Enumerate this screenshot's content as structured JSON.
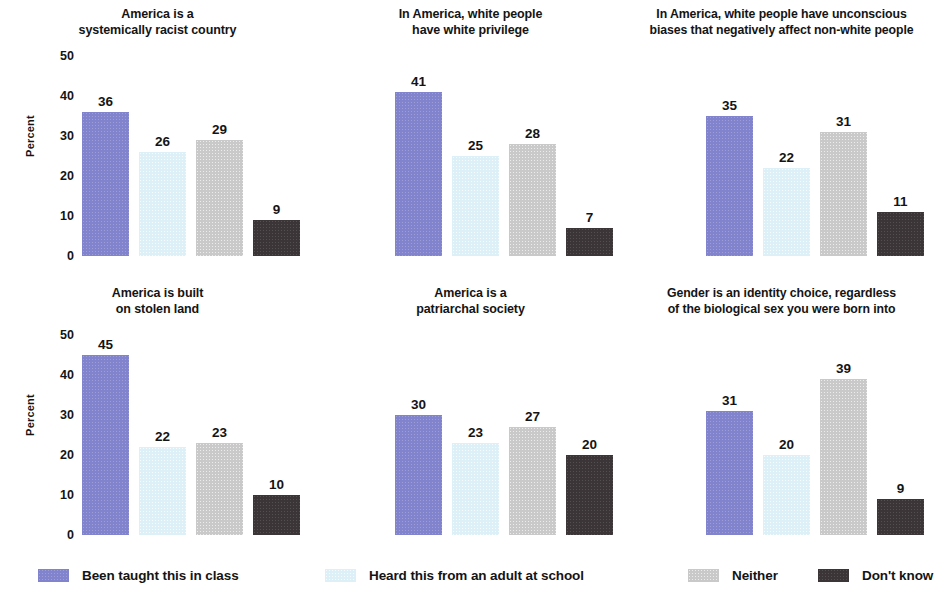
{
  "chart_data": {
    "type": "bar",
    "title": "",
    "subtitle": "",
    "xlabel": "",
    "ylabel": "Percent",
    "ylim": [
      0,
      50
    ],
    "yticks": [
      50,
      40,
      30,
      20,
      10,
      0
    ],
    "grid": false,
    "legend_position": "bottom",
    "categories": [
      "Been taught this in class",
      "Heard this from an adult at school",
      "Neither",
      "Don't know"
    ],
    "legend": [
      {
        "label": "Been taught this in class",
        "color": "#8183cc",
        "key": "taught"
      },
      {
        "label": "Heard this from an adult at school",
        "color": "#ddf0f7",
        "key": "heard"
      },
      {
        "label": "Neither",
        "color": "#c9c9c9",
        "key": "neither"
      },
      {
        "label": "Don't know",
        "color": "#3b3537",
        "key": "dontknow"
      }
    ],
    "panels": [
      {
        "title": "America is a\nsystemically racist country",
        "values": [
          36,
          26,
          29,
          9
        ],
        "show_axis": true
      },
      {
        "title": "In America, white people\nhave white privilege",
        "values": [
          41,
          25,
          28,
          7
        ],
        "show_axis": false
      },
      {
        "title": "In America, white people have unconscious\nbiases that negatively affect non-white people",
        "values": [
          35,
          22,
          31,
          11
        ],
        "show_axis": false
      },
      {
        "title": "America is built\non stolen land",
        "values": [
          45,
          22,
          23,
          10
        ],
        "show_axis": true
      },
      {
        "title": "America is a\npatriarchal society",
        "values": [
          30,
          23,
          27,
          20
        ],
        "show_axis": false
      },
      {
        "title": "Gender is an identity choice, regardless\nof the biological sex you were born into",
        "values": [
          31,
          20,
          39,
          9
        ],
        "show_axis": false
      }
    ]
  }
}
